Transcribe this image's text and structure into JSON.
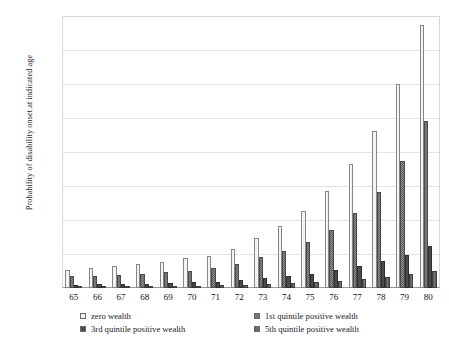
{
  "chart_data": {
    "type": "bar",
    "title": "",
    "subtitle": "",
    "xlabel": "",
    "ylabel": "Probability of disability onset at indicated age",
    "categories": [
      "65",
      "66",
      "67",
      "68",
      "69",
      "70",
      "71",
      "72",
      "73",
      "74",
      "75",
      "76",
      "77",
      "78",
      "79",
      "80"
    ],
    "ylim": [
      0,
      0.16
    ],
    "yticks": [
      0.0,
      0.02,
      0.04,
      0.06,
      0.08,
      0.1,
      0.12,
      0.14,
      0.16
    ],
    "ytick_labels": [
      "0.00",
      "0.02",
      "0.04",
      "0.06",
      "0.08",
      "0.10",
      "0.12",
      "0.14",
      "0.16"
    ],
    "grid": true,
    "legend_position": "bottom",
    "series": [
      {
        "name": "zero wealth",
        "key": "s0",
        "fill": "light-dotted",
        "color": "#f3f3f3",
        "values": [
          0.0105,
          0.0115,
          0.0128,
          0.014,
          0.0155,
          0.0175,
          0.019,
          0.023,
          0.0295,
          0.0365,
          0.0455,
          0.057,
          0.073,
          0.0925,
          0.12,
          0.155
        ]
      },
      {
        "name": "1st quintile positive wealth",
        "key": "s1",
        "fill": "dark-checker",
        "color": "#8e8e8e",
        "values": [
          0.0068,
          0.0072,
          0.0078,
          0.0085,
          0.0093,
          0.0102,
          0.0118,
          0.014,
          0.018,
          0.0215,
          0.0268,
          0.034,
          0.044,
          0.0565,
          0.0745,
          0.098
        ]
      },
      {
        "name": "3rd quintile positive wealth",
        "key": "s2",
        "fill": "dark-solid",
        "color": "#4b4b4b",
        "values": [
          0.002,
          0.0022,
          0.0024,
          0.0026,
          0.0029,
          0.0033,
          0.0038,
          0.0046,
          0.0057,
          0.007,
          0.0085,
          0.0105,
          0.013,
          0.016,
          0.0196,
          0.025
        ]
      },
      {
        "name": "5th quintile positive wealth",
        "key": "s3",
        "fill": "mid-grey-hatch",
        "color": "#787878",
        "values": [
          0.0008,
          0.0009,
          0.001,
          0.0011,
          0.0012,
          0.0014,
          0.0016,
          0.0019,
          0.0023,
          0.0028,
          0.0034,
          0.0042,
          0.0052,
          0.0065,
          0.008,
          0.01
        ]
      }
    ]
  },
  "legend": {
    "items": [
      {
        "label": "zero wealth",
        "key": "s0"
      },
      {
        "label": "1st quintile positive wealth",
        "key": "s1"
      },
      {
        "label": "3rd quintile positive wealth",
        "key": "s2"
      },
      {
        "label": "5th quintile positive wealth",
        "key": "s3"
      }
    ]
  }
}
